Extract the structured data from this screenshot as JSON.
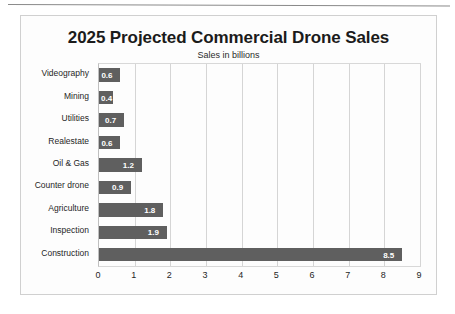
{
  "chart_data": {
    "type": "bar",
    "orientation": "horizontal",
    "title": "2025 Projected Commercial Drone Sales",
    "subtitle": "Sales in billions",
    "xlabel": "",
    "ylabel": "",
    "xlim": [
      0,
      9
    ],
    "xticks": [
      "0",
      "1",
      "2",
      "3",
      "4",
      "5",
      "6",
      "7",
      "8",
      "9"
    ],
    "grid": true,
    "legend": false,
    "bar_color": "#5f5f5f",
    "value_label_color": "#ffffff",
    "categories": [
      "Videography",
      "Mining",
      "Utilities",
      "Realestate",
      "Oil & Gas",
      "Counter drone",
      "Agriculture",
      "Inspection",
      "Construction"
    ],
    "values": [
      0.6,
      0.4,
      0.7,
      0.6,
      1.2,
      0.9,
      1.8,
      1.9,
      8.5
    ],
    "value_labels": [
      "0.6",
      "0.4",
      "0.7",
      "0.6",
      "1.2",
      "0.9",
      "1.8",
      "1.9",
      "8.5"
    ]
  },
  "frame": {
    "border_color": "#d0d0d0",
    "background": "#fdfdfd"
  }
}
